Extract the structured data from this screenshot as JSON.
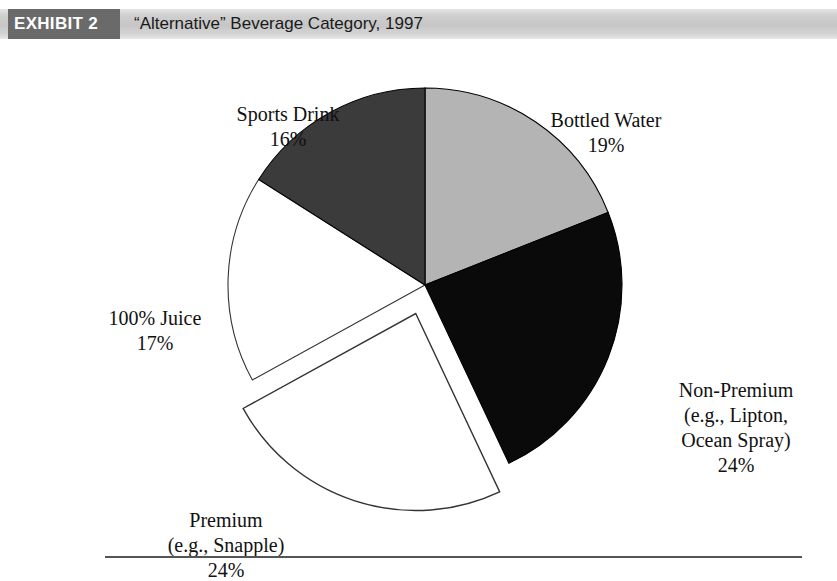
{
  "header": {
    "badge_label": "EXHIBIT 2",
    "title": "“Alternative” Beverage Category, 1997",
    "badge_bg": "#6a6a6a",
    "band_bg": "#c8c8c8",
    "badge_text_color": "#ffffff"
  },
  "chart_data": {
    "type": "pie",
    "title": "“Alternative” Beverage Category, 1997",
    "subtitle": "",
    "xlabel": "",
    "ylabel": "",
    "legend_position": "none",
    "grid": false,
    "units": "percent",
    "start_angle_deg": 0,
    "direction": "clockwise",
    "total": 100,
    "categories": [
      "Bottled Water",
      "Non-Premium (e.g., Lipton, Ocean Spray)",
      "Premium (e.g., Snapple)",
      "100% Juice",
      "Sports Drink"
    ],
    "values": [
      19,
      24,
      24,
      17,
      16
    ],
    "slices": [
      {
        "key": "bottled-water",
        "name": "Bottled Water",
        "value": 19,
        "value_label": "19%",
        "fill": "#b4b4b4",
        "stroke": "#000000",
        "exploded": false,
        "label_lines": [
          "Bottled Water",
          "19%"
        ]
      },
      {
        "key": "non-premium",
        "name": "Non-Premium (e.g., Lipton, Ocean Spray)",
        "value": 24,
        "value_label": "24%",
        "fill": "#0a0a0a",
        "stroke": "#000000",
        "exploded": false,
        "label_lines": [
          "Non-Premium",
          "(e.g., Lipton,",
          "Ocean Spray)",
          "24%"
        ]
      },
      {
        "key": "premium",
        "name": "Premium (e.g., Snapple)",
        "value": 24,
        "value_label": "24%",
        "fill": "#ffffff",
        "stroke": "#333333",
        "exploded": true,
        "label_lines": [
          "Premium",
          "(e.g., Snapple)",
          "24%"
        ]
      },
      {
        "key": "juice",
        "name": "100% Juice",
        "value": 17,
        "value_label": "17%",
        "fill": "#ffffff",
        "stroke": "#333333",
        "exploded": false,
        "label_lines": [
          "100% Juice",
          "17%"
        ]
      },
      {
        "key": "sports-drink",
        "name": "Sports Drink",
        "value": 16,
        "value_label": "16%",
        "fill": "#3b3b3b",
        "stroke": "#000000",
        "exploded": false,
        "label_lines": [
          "Sports Drink",
          "16%"
        ]
      }
    ]
  },
  "labels": {
    "sports_drink": {
      "line1": "Sports Drink",
      "line2": "16%"
    },
    "bottled_water": {
      "line1": "Bottled Water",
      "line2": "19%"
    },
    "non_premium": {
      "line1": "Non-Premium",
      "line2": "(e.g., Lipton,",
      "line3": "Ocean Spray)",
      "line4": "24%"
    },
    "premium": {
      "line1": "Premium",
      "line2": "(e.g., Snapple)",
      "line3": "24%"
    },
    "juice": {
      "line1": "100% Juice",
      "line2": "17%"
    }
  }
}
